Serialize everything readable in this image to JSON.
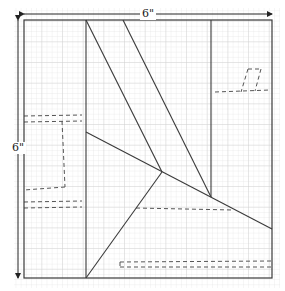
{
  "diagram": {
    "type": "quilt-block-pattern",
    "width_label": "6\"",
    "height_label": "6\"",
    "colors": {
      "grid": "#dcdcdc",
      "line": "#3a3a3a",
      "dashed": "#555555",
      "dimension": "#222222"
    },
    "frame": {
      "x": 24,
      "y": 20,
      "w": 248,
      "h": 258
    },
    "solid_lines": [
      {
        "x1": 86,
        "y1": 20,
        "x2": 86,
        "y2": 278
      },
      {
        "x1": 211,
        "y1": 20,
        "x2": 211,
        "y2": 197
      },
      {
        "x1": 86,
        "y1": 20,
        "x2": 162,
        "y2": 172
      },
      {
        "x1": 123,
        "y1": 20,
        "x2": 211,
        "y2": 197
      },
      {
        "x1": 86,
        "y1": 132,
        "x2": 272,
        "y2": 229
      },
      {
        "x1": 162,
        "y1": 172,
        "x2": 86,
        "y2": 278
      }
    ],
    "dashed_lines": [
      {
        "x1": 24,
        "y1": 116,
        "x2": 82,
        "y2": 115
      },
      {
        "x1": 24,
        "y1": 122,
        "x2": 82,
        "y2": 121
      },
      {
        "x1": 62,
        "y1": 121,
        "x2": 65,
        "y2": 187
      },
      {
        "x1": 65,
        "y1": 187,
        "x2": 24,
        "y2": 190
      },
      {
        "x1": 24,
        "y1": 202,
        "x2": 82,
        "y2": 201
      },
      {
        "x1": 24,
        "y1": 208,
        "x2": 82,
        "y2": 207
      },
      {
        "x1": 215,
        "y1": 92,
        "x2": 270,
        "y2": 90
      },
      {
        "x1": 248,
        "y1": 69,
        "x2": 261,
        "y2": 69
      },
      {
        "x1": 248,
        "y1": 69,
        "x2": 241,
        "y2": 92
      },
      {
        "x1": 261,
        "y1": 69,
        "x2": 255,
        "y2": 91
      },
      {
        "x1": 136,
        "y1": 208,
        "x2": 233,
        "y2": 210
      },
      {
        "x1": 120,
        "y1": 262,
        "x2": 272,
        "y2": 261
      },
      {
        "x1": 120,
        "y1": 267,
        "x2": 272,
        "y2": 267
      },
      {
        "x1": 120,
        "y1": 262,
        "x2": 120,
        "y2": 267
      }
    ]
  }
}
